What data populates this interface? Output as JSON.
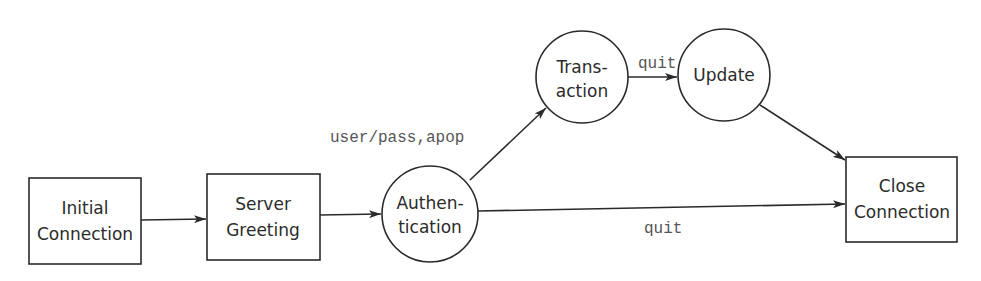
{
  "diagram": {
    "type": "state-diagram",
    "nodes": [
      {
        "id": "initial",
        "shape": "rect",
        "lines": [
          "Initial",
          "Connection"
        ]
      },
      {
        "id": "greeting",
        "shape": "rect",
        "lines": [
          "Server",
          "Greeting"
        ]
      },
      {
        "id": "auth",
        "shape": "circle",
        "lines": [
          "Authen-",
          "tication"
        ]
      },
      {
        "id": "transaction",
        "shape": "circle",
        "lines": [
          "Trans-",
          "action"
        ]
      },
      {
        "id": "update",
        "shape": "circle",
        "lines": [
          "Update"
        ]
      },
      {
        "id": "close",
        "shape": "rect",
        "lines": [
          "Close",
          "Connection"
        ]
      }
    ],
    "edges": [
      {
        "from": "initial",
        "to": "greeting",
        "label": ""
      },
      {
        "from": "greeting",
        "to": "auth",
        "label": ""
      },
      {
        "from": "auth",
        "to": "transaction",
        "label": "user/pass,apop"
      },
      {
        "from": "transaction",
        "to": "update",
        "label": "quit"
      },
      {
        "from": "update",
        "to": "close",
        "label": ""
      },
      {
        "from": "auth",
        "to": "close",
        "label": "quit"
      }
    ]
  }
}
